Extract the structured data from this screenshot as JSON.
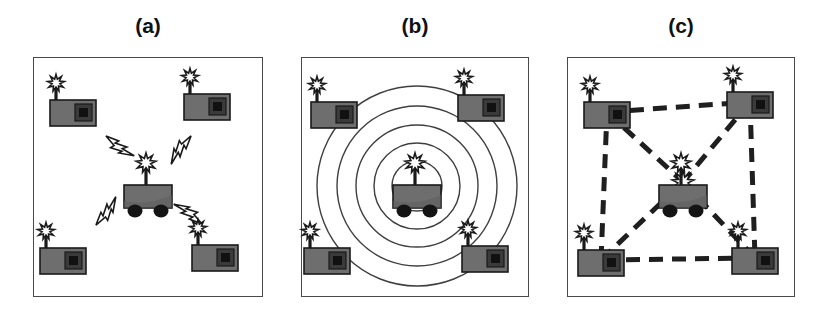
{
  "figure": {
    "type": "diagram",
    "background_color": "#ffffff",
    "stroke_color": "#4a4a4a",
    "body_fill": "#6e6e6e",
    "dark_fill": "#262626",
    "panel_count": 3
  },
  "panels": [
    {
      "id": "panel-a",
      "label": "(a)",
      "box": {
        "x": 33,
        "y": 57,
        "w": 230,
        "h": 240
      },
      "title_y": 14,
      "robot": {
        "x": 148,
        "y": 207,
        "scale": 1.0
      },
      "nodes": [
        {
          "id": "node-tl",
          "x": 73,
          "y": 110
        },
        {
          "id": "node-tr",
          "x": 207,
          "y": 104
        },
        {
          "id": "node-bl",
          "x": 63,
          "y": 258
        },
        {
          "id": "node-br",
          "x": 215,
          "y": 255
        }
      ],
      "bolts": [
        {
          "id": "bolt-up-left",
          "x": 118,
          "y": 148,
          "rot": -45
        },
        {
          "id": "bolt-up-right",
          "x": 179,
          "y": 148,
          "rot": 45
        },
        {
          "id": "bolt-down-left",
          "x": 108,
          "y": 213,
          "rot": -135
        },
        {
          "id": "bolt-down-right",
          "x": 190,
          "y": 212,
          "rot": 135
        }
      ],
      "rings": [],
      "links": []
    },
    {
      "id": "panel-b",
      "label": "(b)",
      "box": {
        "x": 301,
        "y": 57,
        "w": 228,
        "h": 240
      },
      "title_y": 14,
      "robot": {
        "x": 417,
        "y": 207,
        "scale": 1.0
      },
      "nodes": [
        {
          "id": "node-tl",
          "x": 334,
          "y": 112
        },
        {
          "id": "node-tr",
          "x": 481,
          "y": 105
        },
        {
          "id": "node-bl",
          "x": 327,
          "y": 258
        },
        {
          "id": "node-br",
          "x": 485,
          "y": 256
        }
      ],
      "bolts": [],
      "rings": {
        "center_x": 417,
        "center_y": 186,
        "radii": [
          25,
          43,
          61,
          80,
          100
        ]
      },
      "links": []
    },
    {
      "id": "panel-c",
      "label": "(c)",
      "box": {
        "x": 567,
        "y": 57,
        "w": 228,
        "h": 240
      },
      "title_y": 14,
      "robot": {
        "x": 683,
        "y": 207,
        "scale": 1.0
      },
      "nodes": [
        {
          "id": "node-tl",
          "x": 607,
          "y": 112
        },
        {
          "id": "node-tr",
          "x": 750,
          "y": 102
        },
        {
          "id": "node-bl",
          "x": 601,
          "y": 260
        },
        {
          "id": "node-br",
          "x": 755,
          "y": 258
        }
      ],
      "bolts": [],
      "rings": [],
      "hub": {
        "x": 683,
        "y": 182
      },
      "links": [
        {
          "id": "link-tl-tr",
          "from": "node-tl",
          "to": "node-tr"
        },
        {
          "id": "link-tr-br",
          "from": "node-tr",
          "to": "node-br"
        },
        {
          "id": "link-br-bl",
          "from": "node-br",
          "to": "node-bl"
        },
        {
          "id": "link-bl-tl",
          "from": "node-bl",
          "to": "node-tl"
        },
        {
          "id": "link-tl-hub",
          "from": "node-tl",
          "to": "hub"
        },
        {
          "id": "link-tr-hub",
          "from": "node-tr",
          "to": "hub"
        },
        {
          "id": "link-bl-hub",
          "from": "node-bl",
          "to": "hub"
        },
        {
          "id": "link-br-hub",
          "from": "node-br",
          "to": "hub"
        }
      ],
      "dash_pattern": "14 9",
      "dash_width": 5
    }
  ],
  "legend_semantics": {
    "robot": "mobile-robot-with-antenna",
    "node": "wireless-sensor-node",
    "bolt": "radio-signal-lightning-bolt",
    "ring": "range-measurement-circle",
    "link": "connectivity-edge"
  }
}
